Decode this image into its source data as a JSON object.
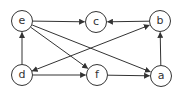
{
  "diagram": {
    "type": "directed-graph",
    "colors": {
      "stroke": "#333333",
      "background": "#ffffff",
      "text": "#333333"
    },
    "nodes": [
      {
        "id": "e",
        "label": "e",
        "x": 22,
        "y": 21
      },
      {
        "id": "c",
        "label": "c",
        "x": 96,
        "y": 22
      },
      {
        "id": "b",
        "label": "b",
        "x": 160,
        "y": 21
      },
      {
        "id": "d",
        "label": "d",
        "x": 22,
        "y": 75
      },
      {
        "id": "f",
        "label": "f",
        "x": 97,
        "y": 75
      },
      {
        "id": "a",
        "label": "a",
        "x": 161,
        "y": 76
      }
    ],
    "edges": [
      {
        "from": "e",
        "to": "c",
        "bidirectional": false
      },
      {
        "from": "b",
        "to": "c",
        "bidirectional": false
      },
      {
        "from": "a",
        "to": "b",
        "bidirectional": false
      },
      {
        "from": "d",
        "to": "e",
        "bidirectional": false
      },
      {
        "from": "e",
        "to": "f",
        "bidirectional": false
      },
      {
        "from": "e",
        "to": "a",
        "bidirectional": false
      },
      {
        "from": "d",
        "to": "f",
        "bidirectional": false
      },
      {
        "from": "f",
        "to": "a",
        "bidirectional": false
      },
      {
        "from": "d",
        "to": "b",
        "bidirectional": true
      }
    ]
  }
}
